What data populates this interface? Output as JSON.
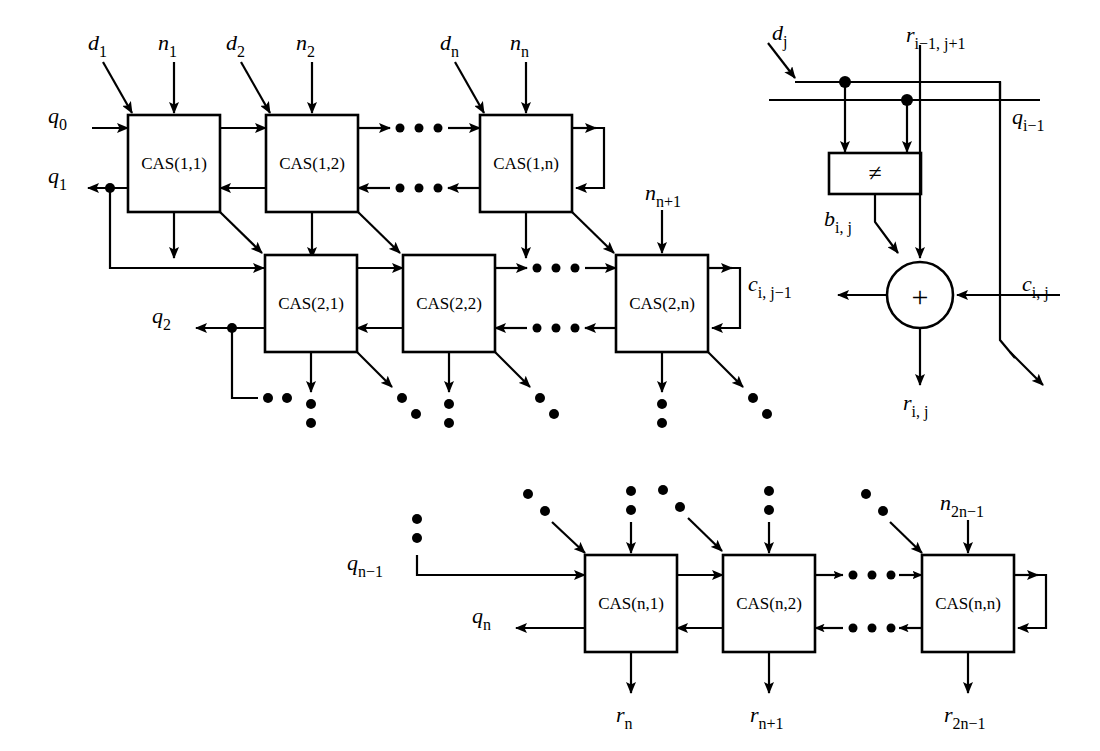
{
  "figure": {
    "kind": "block-diagram",
    "title_visible": false,
    "background": "#ffffff",
    "ink": "#000000"
  },
  "array_diagram": {
    "name": "cellular-array-divider",
    "rows": [
      {
        "row_index": 1,
        "cells": [
          {
            "label": "CAS(1,1)",
            "top_inputs": [
              "d_1",
              "n_1"
            ]
          },
          {
            "label": "CAS(1,2)",
            "top_inputs": [
              "d_2",
              "n_2"
            ]
          },
          {
            "label": "CAS(1,n)",
            "top_inputs": [
              "d_n",
              "n_n"
            ]
          }
        ],
        "left_input": "q_0",
        "left_output": "q_1",
        "ellipsis_between": true
      },
      {
        "row_index": 2,
        "cells": [
          {
            "label": "CAS(2,1)",
            "top_inputs": []
          },
          {
            "label": "CAS(2,2)",
            "top_inputs": []
          },
          {
            "label": "CAS(2,n)",
            "top_inputs": [
              "n_n+1"
            ]
          }
        ],
        "left_output": "q_2",
        "ellipsis_between": true
      },
      {
        "row_index": 3,
        "cells": [
          {
            "label": "CAS(n,1)",
            "top_inputs": []
          },
          {
            "label": "CAS(n,2)",
            "top_inputs": []
          },
          {
            "label": "CAS(n,n)",
            "top_inputs": [
              "n_2n-1"
            ]
          }
        ],
        "left_input": "q_n-1",
        "left_output": "q_n",
        "bottom_outputs": [
          "r_n",
          "r_n+1",
          "r_2n-1"
        ],
        "ellipsis_between": true
      }
    ]
  },
  "labels": {
    "d1": {
      "base": "d",
      "sub": "1",
      "italic_base": true
    },
    "n1": {
      "base": "n",
      "sub": "1",
      "italic_base": true
    },
    "d2": {
      "base": "d",
      "sub": "2",
      "italic_base": true
    },
    "n2": {
      "base": "n",
      "sub": "2",
      "italic_base": true
    },
    "dn": {
      "base": "d",
      "sub": "n",
      "italic_base": true
    },
    "nn": {
      "base": "n",
      "sub": "n",
      "italic_base": true
    },
    "q0": {
      "base": "q",
      "sub": "0",
      "italic_base": true
    },
    "q1": {
      "base": "q",
      "sub": "1",
      "italic_base": true
    },
    "q2": {
      "base": "q",
      "sub": "2",
      "italic_base": true
    },
    "nn1": {
      "base": "n",
      "sub": "n+1",
      "italic_base": true
    },
    "qn1": {
      "base": "q",
      "sub": "n−1",
      "italic_base": true
    },
    "qn": {
      "base": "q",
      "sub": "n",
      "italic_base": true
    },
    "n2n1": {
      "base": "n",
      "sub": "2n−1",
      "italic_base": true
    },
    "rn": {
      "base": "r",
      "sub": "n",
      "italic_base": true
    },
    "rn1": {
      "base": "r",
      "sub": "n+1",
      "italic_base": true
    },
    "r2n1": {
      "base": "r",
      "sub": "2n−1",
      "italic_base": true
    },
    "cas11": "CAS(1,1)",
    "cas12": "CAS(1,2)",
    "cas1n": "CAS(1,n)",
    "cas21": "CAS(2,1)",
    "cas22": "CAS(2,2)",
    "cas2n": "CAS(2,n)",
    "casn1": "CAS(n,1)",
    "casn2": "CAS(n,2)",
    "casnn": "CAS(n,n)"
  },
  "cell_detail": {
    "name": "cas-cell-internal",
    "comparator": {
      "symbol": "≠",
      "shape": "rectangle"
    },
    "adder": {
      "symbol": "+",
      "shape": "circle"
    },
    "signals": {
      "dj": {
        "base": "d",
        "sub": "j",
        "italic_base": true
      },
      "rprev": {
        "base": "r",
        "sub": "i−1, j+1",
        "italic_base": true
      },
      "qprev": {
        "base": "q",
        "sub": "i−1",
        "italic_base": true
      },
      "bij": {
        "base": "b",
        "sub": "i, j",
        "italic_base": true
      },
      "cleft": {
        "base": "c",
        "sub": "i, j−1",
        "italic_base": true
      },
      "cright": {
        "base": "c",
        "sub": "i, j",
        "italic_base": true
      },
      "rij": {
        "base": "r",
        "sub": "i, j",
        "italic_base": true
      }
    }
  }
}
